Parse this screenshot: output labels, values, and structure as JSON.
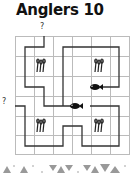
{
  "puzzle": {
    "title": "Anglers 10",
    "rows": 6,
    "cols": 6,
    "clues": {
      "top": {
        "label": "?",
        "column": 2
      },
      "left": {
        "label": "?",
        "row": 4
      }
    },
    "icons": {
      "angler": "fishing-rods-icon",
      "fish": "fish-icon"
    },
    "anglers": [
      {
        "row": 2,
        "col": 2
      },
      {
        "row": 2,
        "col": 5
      },
      {
        "row": 5,
        "col": 2
      },
      {
        "row": 5,
        "col": 5
      }
    ],
    "fish": [
      {
        "row": 3,
        "col": 5
      },
      {
        "row": 4,
        "col": 4
      }
    ],
    "colors": {
      "grid": "#bbbbbb",
      "path": "#333333",
      "ink": "#111111",
      "decor": "#999999"
    }
  }
}
